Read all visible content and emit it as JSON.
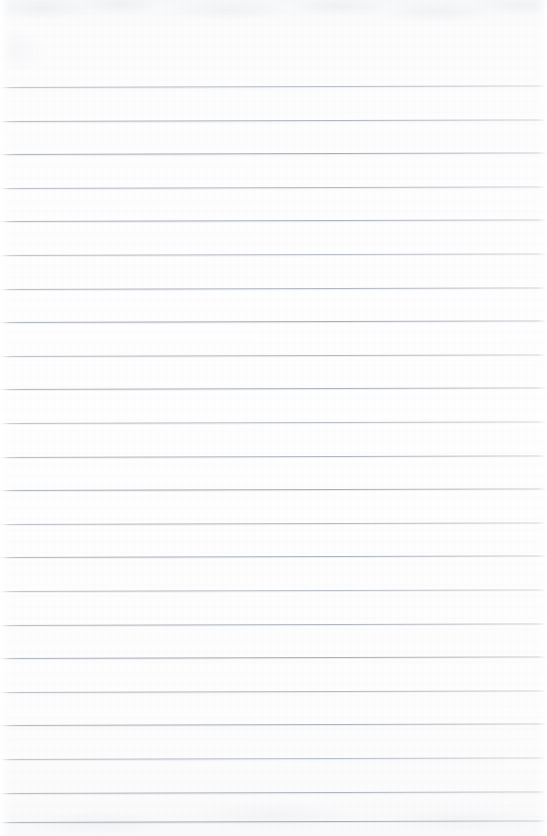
{
  "document": {
    "kind": "scanned-lined-paper",
    "title": "Blank Ruled Notebook Page",
    "description": "A scanned blank sheet of ruled writing paper with no handwriting, no printed text and no margin rule.",
    "page_width": 547,
    "page_height": 836,
    "orientation": "portrait",
    "content_text": "",
    "has_handwriting": false,
    "has_printed_text": false,
    "has_margin_rule": false,
    "has_holes": false,
    "header_text": "",
    "footer_text": "",
    "page_number": ""
  },
  "colors": {
    "paper_background": "#fdfdfd",
    "paper_top_tint": "#f7f8f9",
    "paper_bottom_tint": "#f8f9fa",
    "rule_line": "#a2aab3",
    "rule_line_soft": "#c8ccd0",
    "edge_highlight": "#ffffff"
  },
  "ruling": {
    "style": "horizontal-ruled",
    "line_count": 23,
    "first_line_y": 87,
    "line_spacing": 33.6,
    "line_thickness": 1,
    "line_left_x": 0,
    "line_right_x": 547,
    "skew_degrees": -0.16,
    "top_margin": 87,
    "bottom_margin": 14,
    "line_positions": [
      87,
      120.6,
      154.2,
      187.8,
      221.4,
      255,
      288.6,
      322.2,
      355.8,
      389.4,
      423,
      456.6,
      490.2,
      523.8,
      557.4,
      591,
      624.6,
      658.2,
      691.8,
      725.4,
      759,
      792.6,
      822
    ]
  }
}
